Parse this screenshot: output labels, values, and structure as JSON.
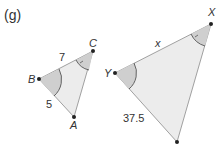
{
  "label": "(g)",
  "small_triangle": {
    "vertices": {
      "B": "B",
      "C": "C",
      "A": "A"
    },
    "side_BC": "7",
    "side_BA": "5"
  },
  "large_triangle": {
    "vertices": {
      "Y": "Y",
      "X": "X"
    },
    "side_YX": "x",
    "side_Y_bottom": "37.5"
  },
  "colors": {
    "fill": "#ececec",
    "angle_fill": "#cfcfcf",
    "stroke": "#777777",
    "point": "#222222"
  }
}
